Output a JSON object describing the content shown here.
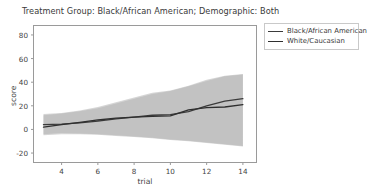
{
  "chart_data": {
    "type": "line",
    "title": "Treatment Group: Black/African American; Demographic: Both",
    "xlabel": "trial",
    "ylabel": "score",
    "xlim": [
      2.45,
      14.75
    ],
    "ylim": [
      -28,
      88
    ],
    "xticks": [
      4,
      6,
      8,
      10,
      12,
      14
    ],
    "yticks": [
      80,
      60,
      40,
      20,
      0,
      -20
    ],
    "xtick_labels": [
      "4",
      "6",
      "8",
      "10",
      "12",
      "14"
    ],
    "ytick_labels": [
      "80",
      "60",
      "40",
      "20",
      "0",
      "-20"
    ],
    "grid": false,
    "legend_position": "right-outside",
    "x": [
      3,
      4,
      5,
      6,
      7,
      8,
      9,
      10,
      11,
      12,
      13,
      14
    ],
    "series": [
      {
        "name": "Black/African American",
        "color": "#3b3b3b",
        "values": [
          4.0,
          4.5,
          5.5,
          7.0,
          9.0,
          10.5,
          12.0,
          12.5,
          15.0,
          20.0,
          24.0,
          26.0
        ],
        "band_lower": [
          -4.0,
          -3.0,
          -3.5,
          -4.0,
          -5.0,
          -6.0,
          -7.0,
          -8.5,
          -9.5,
          -11.0,
          -12.5,
          -14.0
        ],
        "band_upper": [
          13.0,
          14.0,
          16.0,
          19.0,
          23.0,
          27.0,
          31.0,
          33.0,
          37.0,
          42.0,
          45.5,
          47.0
        ]
      },
      {
        "name": "White/Caucasian",
        "color": "#2f2f2f",
        "values": [
          2.0,
          4.0,
          6.0,
          8.0,
          9.5,
          10.5,
          11.0,
          11.5,
          16.5,
          18.5,
          19.0,
          21.0
        ],
        "band_lower": [
          -5.0,
          -4.0,
          -4.0,
          -4.5,
          -5.5,
          -6.5,
          -7.5,
          -9.0,
          -10.0,
          -11.5,
          -13.0,
          -14.5
        ],
        "band_upper": [
          12.0,
          13.5,
          15.5,
          18.0,
          22.0,
          26.0,
          30.0,
          32.5,
          36.5,
          41.0,
          45.0,
          46.5
        ]
      }
    ],
    "band_color": "#b3b3b3",
    "band_opacity": 0.55,
    "frame_color": "#9a9a9a",
    "background": "#ffffff"
  },
  "legend": {
    "entries": [
      {
        "label": "Black/African American"
      },
      {
        "label": "White/Caucasian"
      }
    ]
  }
}
